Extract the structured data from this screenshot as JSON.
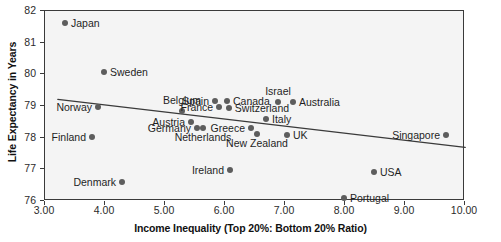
{
  "chart_data": {
    "type": "scatter",
    "title": "",
    "xlabel": "Income Inequality (Top 20%: Bottom 20% Ratio)",
    "ylabel": "Life Expectancy in Years",
    "xlim": [
      3.0,
      10.0
    ],
    "ylim": [
      76,
      82
    ],
    "grid": false,
    "legend": "none",
    "xticks": [
      "3.00",
      "4.00",
      "5.00",
      "6.00",
      "7.00",
      "8.00",
      "9.00",
      "10.00"
    ],
    "xtick_values": [
      3,
      4,
      5,
      6,
      7,
      8,
      9,
      10
    ],
    "yticks": [
      "82",
      "81",
      "80",
      "79",
      "78",
      "77",
      "76"
    ],
    "ytick_values": [
      82,
      81,
      80,
      79,
      78,
      77,
      76
    ],
    "point_color": "#5d5d5d",
    "plot_background": "#f4f4f4",
    "axis_color": "#3a3a3a",
    "trendline": {
      "color": "#3a3a3a",
      "x_start": 3.23,
      "y_start": 79.18,
      "x_end": 10.02,
      "y_end": 77.66
    },
    "points": [
      {
        "label": "Japan",
        "x": 3.35,
        "y": 81.6,
        "label_pos": "right"
      },
      {
        "label": "Sweden",
        "x": 4.0,
        "y": 80.05,
        "label_pos": "right"
      },
      {
        "label": "Norway",
        "x": 3.9,
        "y": 78.95,
        "label_pos": "left"
      },
      {
        "label": "Finland",
        "x": 3.8,
        "y": 78.0,
        "label_pos": "left"
      },
      {
        "label": "Denmark",
        "x": 4.3,
        "y": 76.57,
        "label_pos": "left"
      },
      {
        "label": "Belgium",
        "x": 5.3,
        "y": 78.8,
        "label_pos": "above"
      },
      {
        "label": "Austria",
        "x": 5.45,
        "y": 78.45,
        "label_pos": "left"
      },
      {
        "label": "Germany",
        "x": 5.55,
        "y": 78.28,
        "label_pos": "left"
      },
      {
        "label": "Netherlands",
        "x": 5.65,
        "y": 78.28,
        "label_pos": "below"
      },
      {
        "label": "Spain",
        "x": 5.85,
        "y": 79.12,
        "label_pos": "left"
      },
      {
        "label": "Canada",
        "x": 6.05,
        "y": 79.12,
        "label_pos": "right"
      },
      {
        "label": "France",
        "x": 5.92,
        "y": 78.95,
        "label_pos": "left"
      },
      {
        "label": "Switzerland",
        "x": 6.08,
        "y": 78.92,
        "label_pos": "right"
      },
      {
        "label": "Greece",
        "x": 6.45,
        "y": 78.28,
        "label_pos": "left"
      },
      {
        "label": "Ireland",
        "x": 6.1,
        "y": 76.95,
        "label_pos": "left"
      },
      {
        "label": "New Zealand",
        "x": 6.55,
        "y": 78.1,
        "label_pos": "below"
      },
      {
        "label": "Italy",
        "x": 6.7,
        "y": 78.55,
        "label_pos": "right"
      },
      {
        "label": "Israel",
        "x": 6.9,
        "y": 79.08,
        "label_pos": "above"
      },
      {
        "label": "Australia",
        "x": 7.15,
        "y": 79.08,
        "label_pos": "right"
      },
      {
        "label": "UK",
        "x": 7.05,
        "y": 78.06,
        "label_pos": "right"
      },
      {
        "label": "Portugal",
        "x": 8.0,
        "y": 76.05,
        "label_pos": "right"
      },
      {
        "label": "USA",
        "x": 8.5,
        "y": 76.9,
        "label_pos": "right"
      },
      {
        "label": "Singapore",
        "x": 9.7,
        "y": 78.05,
        "label_pos": "left"
      }
    ]
  }
}
